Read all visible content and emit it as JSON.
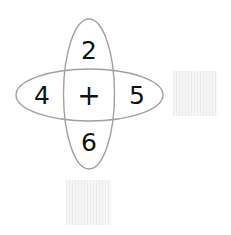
{
  "diagram": {
    "center_operator": "+",
    "top": "2",
    "bottom": "6",
    "left": "4",
    "right": "5"
  },
  "answer_boxes": [
    {
      "position": "right",
      "value": ""
    },
    {
      "position": "bottom",
      "value": ""
    }
  ],
  "colors": {
    "ellipse_stroke": "#a0a0a0",
    "text": "#111111",
    "box_fill": "#f0f0f0"
  }
}
